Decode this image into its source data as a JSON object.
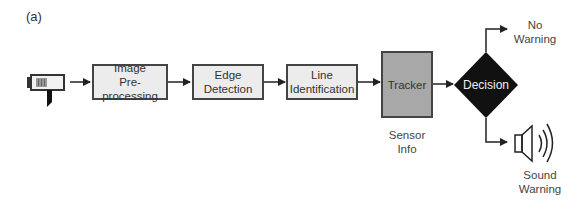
{
  "figure": {
    "panel_label": "(a)",
    "nodes": [
      {
        "id": "camera",
        "type": "icon",
        "label": ""
      },
      {
        "id": "preproc",
        "line1": "Image",
        "line2": "Pre-processing"
      },
      {
        "id": "edge",
        "line1": "Edge",
        "line2": "Detection"
      },
      {
        "id": "line",
        "line1": "Line",
        "line2": "Identification"
      },
      {
        "id": "tracker",
        "line1": "Tracker"
      },
      {
        "id": "decision",
        "line1": "Decision"
      }
    ],
    "sensor_caption": {
      "line1": "Sensor",
      "line2": "Info"
    },
    "outputs": {
      "no_warning": {
        "line1": "No",
        "line2": "Warning"
      },
      "sound_warning": {
        "line1": "Sound",
        "line2": "Warning"
      }
    },
    "colors": {
      "process_fill": "#ececec",
      "tracker_fill": "#a8a8a8",
      "decision_fill": "#111111",
      "stroke": "#444444"
    }
  }
}
